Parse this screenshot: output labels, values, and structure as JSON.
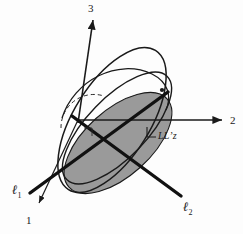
{
  "figure": {
    "background_color": "#fdfdfd",
    "stroke_color": "#1a1a1a",
    "shade_color": "#9a9a9a",
    "width": 243,
    "height": 234
  },
  "axes": {
    "origin": {
      "x": 78,
      "y": 120
    },
    "items": [
      {
        "name": "axis-1",
        "label": "1",
        "direction": "down-left",
        "tip": {
          "x": 36,
          "y": 207
        }
      },
      {
        "name": "axis-2",
        "label": "2",
        "direction": "right",
        "tip": {
          "x": 226,
          "y": 120
        }
      },
      {
        "name": "axis-3",
        "label": "3",
        "direction": "up",
        "tip": {
          "x": 93,
          "y": 18
        }
      }
    ]
  },
  "lines": [
    {
      "name": "line-l1",
      "label": "ℓ",
      "subscript": "1",
      "direction": "down-left",
      "endpoint": {
        "x": 28,
        "y": 195
      }
    },
    {
      "name": "line-l2",
      "label": "ℓ",
      "subscript": "2",
      "direction": "down-right",
      "endpoint": {
        "x": 180,
        "y": 197
      }
    }
  ],
  "annotations": {
    "right_angle_label": "LL’z",
    "right_angle_marker": {
      "x": 148,
      "y": 133
    }
  },
  "shapes": {
    "shaded_disk": "tilted filled ellipse representing a plane",
    "tilted_ellipse": "large unfilled ellipse outline",
    "flat_ellipse": "second unfilled ellipse outline",
    "hidden_arc": "dashed arc for hidden back edge",
    "point_marker": {
      "x": 162,
      "y": 90
    }
  }
}
